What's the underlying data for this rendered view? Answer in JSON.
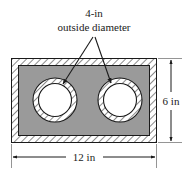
{
  "figure": {
    "name": "cross-section-of-rectangular-block-with-two-holes",
    "callout": {
      "line1": "4-in",
      "line2": "outside diameter",
      "leader_count": 2
    },
    "dimensions": {
      "width_label": "12 in",
      "height_label": "6 in"
    },
    "colors": {
      "body_fill": "#9a9a9a",
      "hatch_band": "#ffffff",
      "hole_fill": "#ffffff",
      "outline": "#1a1a1a",
      "background": "#ffffff"
    },
    "geometry": {
      "rect": {
        "x": 11,
        "y": 58,
        "width": 146,
        "height": 85
      },
      "wall_thickness": 7,
      "holes": [
        {
          "name": "left-hole",
          "cx": 55,
          "cy": 100,
          "r_outer": 22,
          "r_inner": 16.5
        },
        {
          "name": "right-hole",
          "cx": 120,
          "cy": 100,
          "r_outer": 22,
          "r_inner": 16.5
        }
      ]
    }
  }
}
